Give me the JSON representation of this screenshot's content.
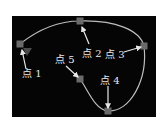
{
  "diagram": {
    "background": "#050505",
    "curve_color": "#bdbdbd",
    "marker_color": "#6a6a6a",
    "arrow_color": "#e6e6e6",
    "points": [
      {
        "id": "p1",
        "label": "点 1",
        "x": 20,
        "y": 44,
        "label_x": 22,
        "label_y": 77,
        "arrow_from": [
          26,
          69
        ],
        "arrow_to": [
          22,
          50
        ]
      },
      {
        "id": "p2",
        "label": "点 2",
        "x": 80,
        "y": 21,
        "label_x": 82,
        "label_y": 57,
        "arrow_from": [
          89,
          44
        ],
        "arrow_to": [
          82,
          27
        ]
      },
      {
        "id": "p3",
        "label": "点 3",
        "x": 144,
        "y": 46,
        "label_x": 105,
        "label_y": 58,
        "arrow_from": [
          124,
          52
        ],
        "arrow_to": [
          141,
          47
        ]
      },
      {
        "id": "p4",
        "label": "点 4",
        "x": 108,
        "y": 111,
        "label_x": 100,
        "label_y": 84,
        "arrow_from": [
          108,
          86
        ],
        "arrow_to": [
          108,
          108
        ]
      },
      {
        "id": "p5",
        "label": "点 5",
        "x": 80,
        "y": 79,
        "label_x": 55,
        "label_y": 63,
        "arrow_from": [
          66,
          66
        ],
        "arrow_to": [
          78,
          77
        ]
      }
    ]
  }
}
